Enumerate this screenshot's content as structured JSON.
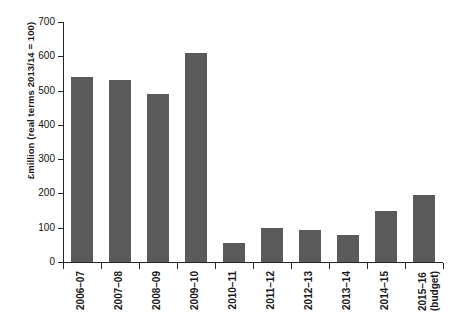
{
  "chart_data": {
    "type": "bar",
    "title": "",
    "subtitle": "",
    "xlabel": "",
    "ylabel": "£million (real terms 2013/14 = 100)",
    "ylim": [
      0,
      700
    ],
    "ytick_step": 100,
    "yticks": [
      "700",
      "600",
      "500",
      "400",
      "300",
      "200",
      "100",
      "0"
    ],
    "grid": false,
    "legend": null,
    "bar_color": "#5a5a5a",
    "axis_color": "#262626",
    "categories": [
      "2006–07",
      "2007–08",
      "2008–09",
      "2009–10",
      "2010–11",
      "2011–12",
      "2012–13",
      "2013–14",
      "2014–15",
      "2015–16"
    ],
    "category_sublabels": [
      "",
      "",
      "",
      "",
      "",
      "",
      "",
      "",
      "",
      "(budget)"
    ],
    "values": [
      540,
      530,
      490,
      610,
      55,
      98,
      92,
      80,
      150,
      195
    ],
    "series": [
      {
        "name": "Expenditure",
        "values": [
          540,
          530,
          490,
          610,
          55,
          98,
          92,
          80,
          150,
          195
        ]
      }
    ]
  },
  "caption": {
    "text": ""
  }
}
